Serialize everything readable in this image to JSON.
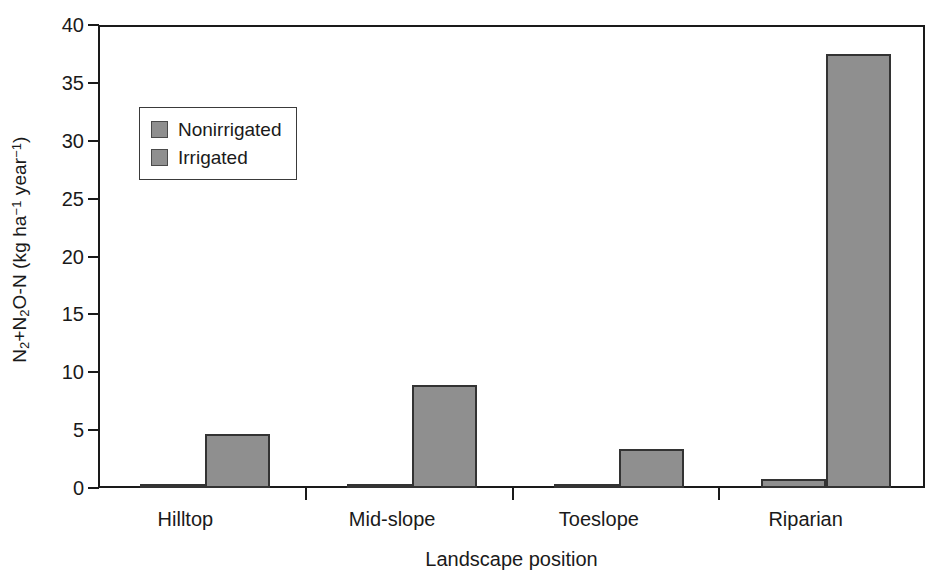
{
  "chart_data": {
    "type": "bar",
    "title": "",
    "subtitle": "",
    "xlabel": "Landscape position",
    "ylabel": "N2+N2O-N (kg ha^-1 year^-1)",
    "ylabel_parts": {
      "prefix": "N",
      "sub1": "2",
      "plus": "+N",
      "sub2": "2",
      "mid": "O-N (kg ha",
      "sup1": "−1",
      "mid2": " year",
      "sup2": "−1",
      "suffix": ")"
    },
    "categories": [
      "Hilltop",
      "Mid-slope",
      "Toeslope",
      "Riparian"
    ],
    "series": [
      {
        "name": "Nonirrigated",
        "values": [
          0.25,
          0.2,
          0.15,
          0.8
        ],
        "color": "#8f8f8f"
      },
      {
        "name": "Irrigated",
        "values": [
          4.7,
          8.9,
          3.4,
          37.5
        ],
        "color": "#8f8f8f"
      }
    ],
    "ylim": [
      0,
      40
    ],
    "yticks": [
      0,
      5,
      10,
      15,
      20,
      25,
      30,
      35,
      40
    ],
    "ytick_labels": [
      "0",
      "5",
      "10",
      "15",
      "20",
      "25",
      "30",
      "35",
      "40"
    ],
    "grid": false,
    "legend_position": "upper-left-inset",
    "bar_edge_color": "#333333",
    "axis_color": "#1a1a1a",
    "background": "#ffffff"
  },
  "legend": {
    "items": [
      {
        "label": "Nonirrigated",
        "swatch": "#8f8f8f"
      },
      {
        "label": "Irrigated",
        "swatch": "#8f8f8f"
      }
    ]
  }
}
